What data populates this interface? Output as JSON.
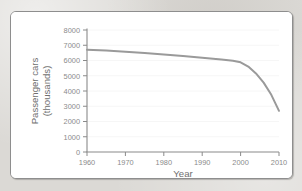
{
  "chart_data": {
    "type": "line",
    "title": "",
    "xlabel": "Year",
    "ylabel": "Passenger cars (thousands)",
    "ylabel_lines": [
      "Passenger cars",
      "(thousands)"
    ],
    "x": [
      1960,
      1965,
      1970,
      1975,
      1980,
      1985,
      1990,
      1995,
      1998,
      2000,
      2002,
      2004,
      2006,
      2008,
      2010
    ],
    "values": [
      6700,
      6650,
      6580,
      6500,
      6400,
      6300,
      6180,
      6060,
      5980,
      5880,
      5600,
      5150,
      4550,
      3750,
      2700
    ],
    "series": [
      {
        "name": "Passenger cars",
        "values": [
          6700,
          6650,
          6580,
          6500,
          6400,
          6300,
          6180,
          6060,
          5980,
          5880,
          5600,
          5150,
          4550,
          3750,
          2700
        ]
      }
    ],
    "xlim": [
      1960,
      2010
    ],
    "ylim": [
      0,
      8000
    ],
    "xticks": [
      1960,
      1970,
      1980,
      1990,
      2000,
      2010
    ],
    "xtick_labels": [
      "1960",
      "1970",
      "1980",
      "1990",
      "2000",
      "2010"
    ],
    "yticks": [
      0,
      1000,
      2000,
      3000,
      4000,
      5000,
      6000,
      7000,
      8000
    ],
    "ytick_labels": [
      "0",
      "1000",
      "2000",
      "3000",
      "4000",
      "5000",
      "6000",
      "7000",
      "8000"
    ],
    "grid": false,
    "legend": false,
    "legend_position": "none",
    "line_color": "#9a9a9a",
    "axis_color": "#8a8a8a",
    "plot_background": "#ffffff",
    "page_background": "#dbd9d5"
  }
}
